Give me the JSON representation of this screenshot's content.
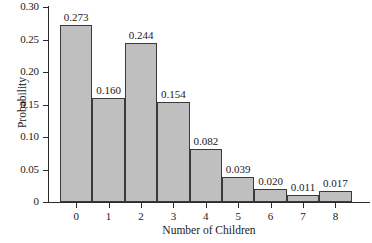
{
  "chart_data": {
    "type": "bar",
    "title": "",
    "subtitle": "",
    "xlabel": "Number of Children",
    "ylabel": "Probability",
    "categories": [
      "0",
      "1",
      "2",
      "3",
      "4",
      "5",
      "6",
      "7",
      "8"
    ],
    "values": [
      0.273,
      0.16,
      0.244,
      0.154,
      0.082,
      0.039,
      0.02,
      0.011,
      0.017
    ],
    "data_labels": [
      "0.273",
      "0.160",
      "0.244",
      "0.154",
      "0.082",
      "0.039",
      "0.020",
      "0.011",
      "0.017"
    ],
    "ylim": [
      0,
      0.3
    ],
    "y_ticks": [
      0,
      0.05,
      0.1,
      0.15,
      0.2,
      0.25,
      0.3
    ],
    "y_tick_labels": [
      "0",
      "0.05",
      "0.10",
      "0.15",
      "0.20",
      "0.25",
      "0.30"
    ],
    "grid": false,
    "legend": null,
    "bar_fill_color": "#bfbfbf",
    "bar_edge_color": "#3a3a3a",
    "axis_color": "#2b2b2b",
    "background_color": "#ffffff"
  }
}
